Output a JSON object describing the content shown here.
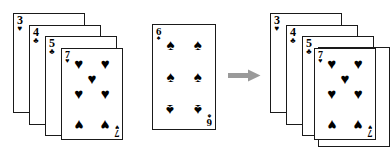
{
  "diagram": {
    "background_color": "#ffffff",
    "ink_color": "#000000",
    "card_border_color": "#1a1a1a",
    "arrow_color": "#9a9a9a",
    "suit_glyphs": {
      "hearts": "♥",
      "spades": "♠",
      "clubs": "♣",
      "diamonds": "♦"
    }
  },
  "arrow": {
    "name": "right-arrow",
    "direction": "right",
    "color": "#9a9a9a"
  },
  "left_stack": {
    "label": "left-card-stack",
    "count": 4,
    "cards": [
      {
        "rank": "3",
        "suit": "hearts",
        "suit_glyph": "♥",
        "pip_count": 3,
        "x": 13,
        "y": 13,
        "w": 72,
        "h": 100,
        "z": 1,
        "face_visible": false
      },
      {
        "rank": "4",
        "suit": "clubs",
        "suit_glyph": "♣",
        "pip_count": 4,
        "x": 29,
        "y": 25,
        "w": 72,
        "h": 100,
        "z": 2,
        "face_visible": false
      },
      {
        "rank": "5",
        "suit": "clubs",
        "suit_glyph": "♣",
        "pip_count": 5,
        "x": 45,
        "y": 36,
        "w": 72,
        "h": 100,
        "z": 3,
        "face_visible": false
      },
      {
        "rank": "7",
        "suit": "hearts",
        "suit_glyph": "♥",
        "pip_count": 7,
        "x": 61,
        "y": 48,
        "w": 62,
        "h": 92,
        "z": 4,
        "face_visible": true
      }
    ]
  },
  "middle_card": {
    "label": "inserted-card",
    "rank": "6",
    "suit": "spades",
    "suit_glyph": "♠",
    "pip_count": 6,
    "x": 7,
    "y": 24,
    "w": 64,
    "h": 106
  },
  "right_stack": {
    "label": "right-card-stack",
    "count": 5,
    "cards": [
      {
        "rank": "3",
        "suit": "hearts",
        "suit_glyph": "♥",
        "pip_count": 3,
        "x": 8,
        "y": 13,
        "w": 72,
        "h": 100,
        "z": 1,
        "face_visible": false
      },
      {
        "rank": "4",
        "suit": "clubs",
        "suit_glyph": "♣",
        "pip_count": 4,
        "x": 24,
        "y": 25,
        "w": 72,
        "h": 100,
        "z": 2,
        "face_visible": false
      },
      {
        "rank": "5",
        "suit": "clubs",
        "suit_glyph": "♣",
        "pip_count": 5,
        "x": 40,
        "y": 36,
        "w": 72,
        "h": 100,
        "z": 3,
        "face_visible": false
      },
      {
        "rank": "6",
        "suit": "clubs",
        "suit_glyph": "♣",
        "pip_count": 6,
        "x": 56,
        "y": 47,
        "w": 72,
        "h": 100,
        "z": 4,
        "face_visible": false
      },
      {
        "rank": "7",
        "suit": "hearts",
        "suit_glyph": "♥",
        "pip_count": 7,
        "x": 52,
        "y": 48,
        "w": 62,
        "h": 92,
        "z": 5,
        "face_visible": true
      }
    ]
  }
}
